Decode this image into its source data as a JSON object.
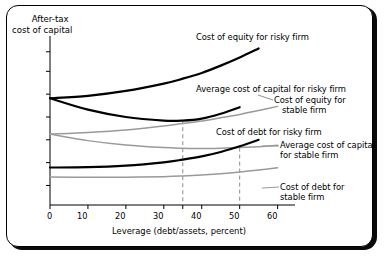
{
  "chart_data": {
    "type": "line",
    "title": "",
    "ylabel_line1": "After-tax",
    "ylabel_line2": "cost of capital",
    "xlabel": "Leverage (debt/assets, percent)",
    "xlim": [
      0,
      63
    ],
    "ylim": [
      0,
      10
    ],
    "xticks": [
      0,
      10,
      20,
      30,
      35,
      40,
      50,
      60
    ],
    "xticklabels": [
      "0",
      "10",
      "20",
      "30",
      "",
      "40",
      "50",
      "60"
    ],
    "yticks": [
      1.2,
      2.6,
      4.0,
      5.4,
      6.8,
      8.2,
      9.4
    ],
    "yticklabels": [
      "",
      "",
      "",
      "",
      "",
      "",
      ""
    ],
    "grid": false,
    "legend": "inline annotations with leader lines",
    "colors": {
      "risky": "#000000",
      "stable": "#9a9a9a",
      "axis": "#000000",
      "dashed": "#8c8c8c"
    },
    "vlines": [
      {
        "x": 35,
        "style": "dashed",
        "note": "optimal leverage, risky firm"
      },
      {
        "x": 50,
        "style": "dashed",
        "note": "optimal leverage, stable firm"
      }
    ],
    "series": [
      {
        "name": "Cost of equity for risky firm",
        "color": "#000000",
        "width": 2.2,
        "x": [
          0,
          10,
          20,
          30,
          35,
          40,
          45,
          50,
          55
        ],
        "y": [
          6.55,
          6.7,
          7.0,
          7.45,
          7.75,
          8.1,
          8.55,
          9.05,
          9.6
        ],
        "label_x": 196,
        "label_y": 36
      },
      {
        "name": "Average cost of capital for risky firm",
        "color": "#000000",
        "width": 2.2,
        "x": [
          0,
          10,
          20,
          30,
          35,
          40,
          45,
          50
        ],
        "y": [
          6.55,
          5.85,
          5.4,
          5.18,
          5.18,
          5.3,
          5.6,
          6.0
        ],
        "label_x": 196,
        "label_y": 88
      },
      {
        "name": "Cost of equity for stable firm",
        "color": "#9a9a9a",
        "width": 1.5,
        "x": [
          0,
          10,
          20,
          30,
          35,
          40,
          45,
          50,
          55,
          60
        ],
        "y": [
          4.35,
          4.45,
          4.6,
          4.85,
          5.0,
          5.15,
          5.35,
          5.55,
          5.8,
          6.05
        ],
        "label_x": 274,
        "label_y": 99
      },
      {
        "name": "Cost of debt for risky firm",
        "color": "#000000",
        "width": 2.2,
        "x": [
          0,
          10,
          20,
          30,
          35,
          40,
          45,
          50,
          55
        ],
        "y": [
          2.3,
          2.32,
          2.42,
          2.62,
          2.78,
          2.98,
          3.25,
          3.6,
          4.0
        ],
        "label_x": 216,
        "label_y": 131
      },
      {
        "name": "Average cost of capital for stable firm",
        "color": "#9a9a9a",
        "width": 1.5,
        "x": [
          0,
          10,
          20,
          30,
          35,
          40,
          45,
          50,
          55,
          60
        ],
        "y": [
          4.35,
          3.95,
          3.68,
          3.52,
          3.48,
          3.46,
          3.48,
          3.52,
          3.58,
          3.66
        ],
        "label_x": 280,
        "label_y": 144
      },
      {
        "name": "Cost of debt for stable firm",
        "color": "#9a9a9a",
        "width": 1.5,
        "x": [
          0,
          10,
          20,
          30,
          35,
          40,
          45,
          50,
          55,
          60
        ],
        "y": [
          1.72,
          1.7,
          1.7,
          1.74,
          1.78,
          1.84,
          1.92,
          2.02,
          2.14,
          2.28
        ],
        "label_x": 280,
        "label_y": 186
      }
    ]
  },
  "annotations": {
    "cost_equity_risky": "Cost of equity for risky firm",
    "avg_cost_risky": "Average cost of capital for risky firm",
    "cost_equity_stable_l1": "Cost of equity for",
    "cost_equity_stable_l2": "stable firm",
    "cost_debt_risky": "Cost of debt for risky firm",
    "avg_cost_stable_l1": "Average cost of capital",
    "avg_cost_stable_l2": "for stable firm",
    "cost_debt_stable_l1": "Cost of debt for",
    "cost_debt_stable_l2": "stable firm"
  },
  "axis": {
    "ytitle_l1": "After-tax",
    "ytitle_l2": "cost of capital",
    "xtitle": "Leverage (debt/assets, percent)",
    "xtick_0": "0",
    "xtick_10": "10",
    "xtick_20": "20",
    "xtick_30": "30",
    "xtick_40": "40",
    "xtick_50": "50",
    "xtick_60": "60"
  }
}
